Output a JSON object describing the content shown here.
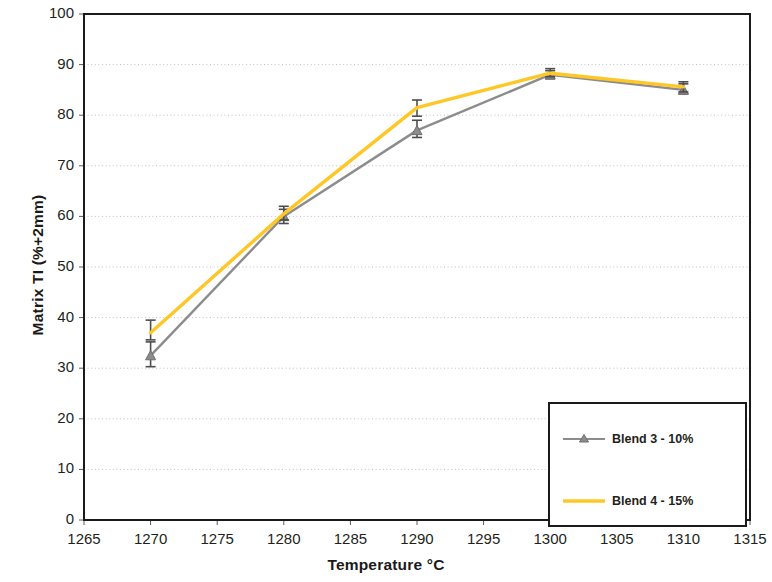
{
  "chart_data": {
    "type": "line",
    "title": "",
    "subtitle": "",
    "xlabel": "Temperature °C",
    "ylabel": "Matrix TI (%+2mm)",
    "xlim": [
      1265,
      1315
    ],
    "ylim": [
      0,
      100
    ],
    "xticks": [
      1265,
      1270,
      1275,
      1280,
      1285,
      1290,
      1295,
      1300,
      1305,
      1310,
      1315
    ],
    "yticks": [
      0,
      10,
      20,
      30,
      40,
      50,
      60,
      70,
      80,
      90,
      100
    ],
    "xtick_labels": [
      "1265",
      "1270",
      "1275",
      "1280",
      "1285",
      "1290",
      "1295",
      "1300",
      "1305",
      "1310",
      "1315"
    ],
    "ytick_labels": [
      "0",
      "10",
      "20",
      "30",
      "40",
      "50",
      "60",
      "70",
      "80",
      "90",
      "100"
    ],
    "grid": {
      "horizontal": true,
      "vertical": false,
      "color": "#bfbfbf",
      "style": "dotted"
    },
    "legend": {
      "position": "bottom-right",
      "border_color": "#1a1a1a",
      "background": "#ffffff"
    },
    "x": [
      1270,
      1280,
      1290,
      1300,
      1310
    ],
    "series": [
      {
        "name": "Blend 3 - 10%",
        "color": "#8c8c8c",
        "marker": "triangle",
        "marker_color": "#8c8c8c",
        "values": [
          32.5,
          60.0,
          77.0,
          88.0,
          85.0
        ],
        "errors": [
          {
            "x": 1270,
            "y": 32.5,
            "low": 30.3,
            "high": 35.2
          },
          {
            "x": 1280,
            "y": 60.0,
            "low": 58.6,
            "high": 61.4
          },
          {
            "x": 1290,
            "y": 77.0,
            "low": 75.6,
            "high": 79.0
          },
          {
            "x": 1300,
            "y": 88.0,
            "low": 87.2,
            "high": 88.8
          },
          {
            "x": 1310,
            "y": 85.0,
            "low": 84.2,
            "high": 86.2
          }
        ]
      },
      {
        "name": "Blend 4 - 15%",
        "color": "#ffc726",
        "marker": "none",
        "marker_color": "#ffc726",
        "values": [
          37.0,
          60.5,
          81.5,
          88.3,
          85.6
        ],
        "errors": [
          {
            "x": 1270,
            "y": 37.0,
            "low": 35.6,
            "high": 39.5
          },
          {
            "x": 1280,
            "y": 60.5,
            "low": 59.3,
            "high": 62.0
          },
          {
            "x": 1290,
            "y": 81.5,
            "low": 79.8,
            "high": 83.0
          },
          {
            "x": 1300,
            "y": 88.3,
            "low": 87.6,
            "high": 89.2
          },
          {
            "x": 1310,
            "y": 85.6,
            "low": 84.6,
            "high": 86.6
          }
        ]
      }
    ],
    "axis_frame": {
      "color": "#1a1a1a",
      "width": 2
    }
  },
  "legend_items": [
    {
      "label": "Blend 3 - 10%",
      "color": "#8c8c8c",
      "marker": "triangle"
    },
    {
      "label": "Blend 4 - 15%",
      "color": "#ffc726",
      "marker": "none"
    }
  ],
  "axes": {
    "x_title": "Temperature °C",
    "y_title": "Matrix TI (%+2mm)"
  }
}
